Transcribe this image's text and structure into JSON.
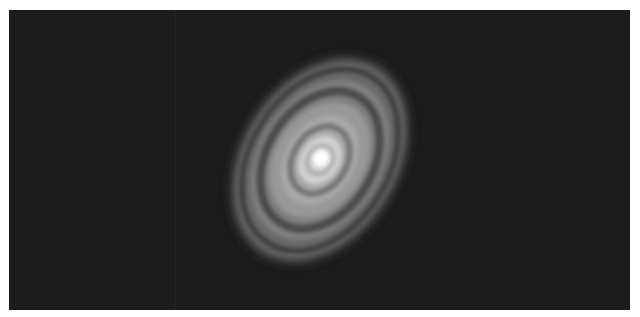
{
  "image": {
    "subject": "protoplanetary-disk",
    "description": "Grayscale image of an inclined circumstellar disk with concentric bright and dark rings around a bright central core",
    "background_color": "#1c1c1c",
    "border_color": "#ffffff",
    "disk": {
      "center": [
        320,
        160
      ],
      "rotation_deg": -58,
      "outer_semi_axes": [
        115,
        80
      ],
      "rings": [
        {
          "rx": 8,
          "ry": 7,
          "color": "#ffffff"
        },
        {
          "rx": 20,
          "ry": 15,
          "color": "#d8d8d8"
        },
        {
          "rx": 32,
          "ry": 24,
          "color": "#6e6e6e"
        },
        {
          "rx": 50,
          "ry": 36,
          "color": "#9a9a9a"
        },
        {
          "rx": 68,
          "ry": 48,
          "color": "#5a5a5a"
        },
        {
          "rx": 82,
          "ry": 58,
          "color": "#7c7c7c"
        },
        {
          "rx": 92,
          "ry": 66,
          "color": "#4e4e4e"
        },
        {
          "rx": 112,
          "ry": 80,
          "color": "#5c5c5c"
        }
      ]
    }
  }
}
